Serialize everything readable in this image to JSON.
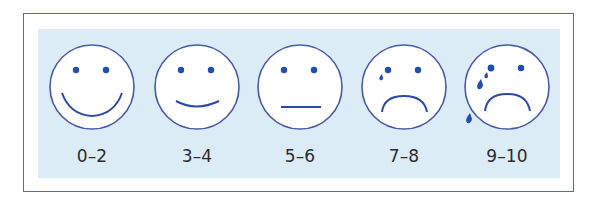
{
  "diagram": {
    "title": "",
    "type": "pain-scale-faces",
    "colors": {
      "outline": "#4a5aa8",
      "feature": "#1e4fb0",
      "panel_background": "#dcecf7",
      "frame_border": "#5a6aa8",
      "face_fill": "#ffffff",
      "label_text": "#2b2b2b"
    },
    "faces": [
      {
        "label": "0–2",
        "expression": "big-smile",
        "tears": 0
      },
      {
        "label": "3–4",
        "expression": "smile",
        "tears": 0
      },
      {
        "label": "5–6",
        "expression": "neutral",
        "tears": 0
      },
      {
        "label": "7–8",
        "expression": "frown",
        "tears": 1
      },
      {
        "label": "9–10",
        "expression": "frown-crying",
        "tears": 3
      }
    ]
  }
}
